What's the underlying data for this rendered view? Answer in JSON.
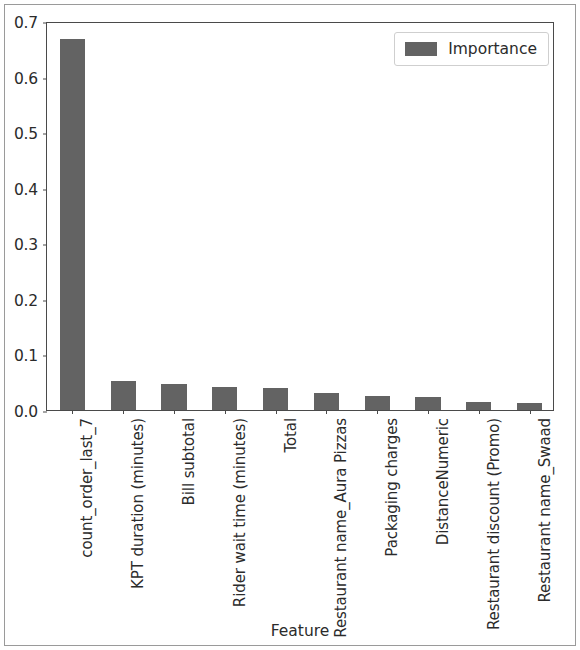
{
  "chart_data": {
    "type": "bar",
    "title": "",
    "xlabel": "Feature",
    "ylabel": "",
    "categories": [
      "count_order_last_7",
      "KPT duration (minutes)",
      "Bill subtotal",
      "Rider wait time (minutes)",
      "Total",
      "Restaurant name_Aura Pizzas",
      "Packaging charges",
      "DistanceNumeric",
      "Restaurant discount (Promo)",
      "Restaurant name_Swaad"
    ],
    "series": [
      {
        "name": "Importance",
        "values": [
          0.667,
          0.052,
          0.046,
          0.041,
          0.039,
          0.03,
          0.026,
          0.024,
          0.015,
          0.012
        ]
      }
    ],
    "ylim": [
      0.0,
      0.7
    ],
    "yticks": [
      "0.0",
      "0.1",
      "0.2",
      "0.3",
      "0.4",
      "0.5",
      "0.6",
      "0.7"
    ],
    "ytick_values": [
      0.0,
      0.1,
      0.2,
      0.3,
      0.4,
      0.5,
      0.6,
      0.7
    ],
    "grid": false,
    "legend": {
      "position": "upper right",
      "entries": [
        {
          "label": "Importance",
          "color": "#636363"
        }
      ]
    },
    "bar_color": "#636363"
  }
}
